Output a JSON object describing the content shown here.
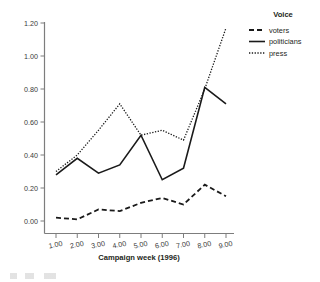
{
  "chart_data": {
    "type": "line",
    "title": "",
    "xlabel": "Campaign week (1996)",
    "ylabel": "",
    "x": [
      1,
      2,
      3,
      4,
      5,
      6,
      7,
      8,
      9
    ],
    "xtick_labels": [
      "1.00",
      "2.00",
      "3.00",
      "4.00",
      "5.00",
      "6.00",
      "7.00",
      "8.00",
      "9.00"
    ],
    "ytick_labels": [
      "0.00",
      "0.20",
      "0.40",
      "0.60",
      "0.80",
      "1.00",
      "1.20"
    ],
    "ytick_values": [
      0.0,
      0.2,
      0.4,
      0.6,
      0.8,
      1.0,
      1.2
    ],
    "ylim": [
      0.0,
      1.2
    ],
    "xlim": [
      1,
      9
    ],
    "grid": false,
    "legend_position": "top-right",
    "legend_title": "Voice",
    "series": [
      {
        "name": "voters",
        "style": "dashed",
        "color": "#1a1a1a",
        "values": [
          0.02,
          0.01,
          0.07,
          0.06,
          0.11,
          0.14,
          0.1,
          0.22,
          0.15
        ]
      },
      {
        "name": "politicians",
        "style": "solid",
        "color": "#1a1a1a",
        "values": [
          0.28,
          0.38,
          0.29,
          0.34,
          0.52,
          0.25,
          0.32,
          0.81,
          0.71
        ]
      },
      {
        "name": "press",
        "style": "dotted",
        "color": "#1a1a1a",
        "values": [
          0.3,
          0.4,
          0.55,
          0.71,
          0.52,
          0.55,
          0.49,
          0.8,
          1.17
        ]
      }
    ]
  },
  "axis": {
    "x_title": "Campaign week (1996)"
  },
  "legend": {
    "title": "Voice",
    "items": [
      {
        "label": "voters",
        "style": "dashed"
      },
      {
        "label": "politicians",
        "style": "solid"
      },
      {
        "label": "press",
        "style": "dotted"
      }
    ]
  }
}
